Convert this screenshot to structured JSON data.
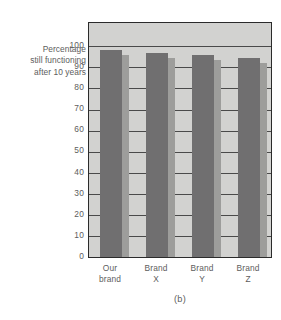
{
  "figure": {
    "caption": "(b)",
    "axis_caption_lines": [
      "Percentage",
      "still functioning",
      "after 10 years"
    ]
  },
  "colors": {
    "bar_fill": "#706f70",
    "bar_shadow": "#9d9d9b",
    "plot_background": "#d2d2d0",
    "frame": "#2b2b2b",
    "gridline": "#4a4a4a",
    "text": "#5d5d5d",
    "page_background": "#ffffff"
  },
  "chart_data": {
    "type": "bar",
    "title": "",
    "subtitle": "",
    "xlabel": "",
    "ylabel": "Percentage still functioning after 10 years",
    "categories": [
      "Our brand",
      "Brand X",
      "Brand Y",
      "Brand Z"
    ],
    "category_lines": [
      [
        "Our",
        "brand"
      ],
      [
        "Brand",
        "X"
      ],
      [
        "Brand",
        "Y"
      ],
      [
        "Brand",
        "Z"
      ]
    ],
    "values": [
      98,
      97,
      96,
      94.5
    ],
    "ylim": [
      0,
      100
    ],
    "yticks": [
      0,
      10,
      20,
      30,
      40,
      50,
      60,
      70,
      80,
      90,
      100
    ],
    "ytick_labels": [
      "0",
      "10",
      "20",
      "30",
      "40",
      "50",
      "60",
      "70",
      "80",
      "90",
      "100"
    ],
    "grid": true,
    "grid_axis": "y",
    "legend": false,
    "legend_position": "none",
    "bar_shadow": true,
    "plot_top_value": 111,
    "annotations": []
  }
}
